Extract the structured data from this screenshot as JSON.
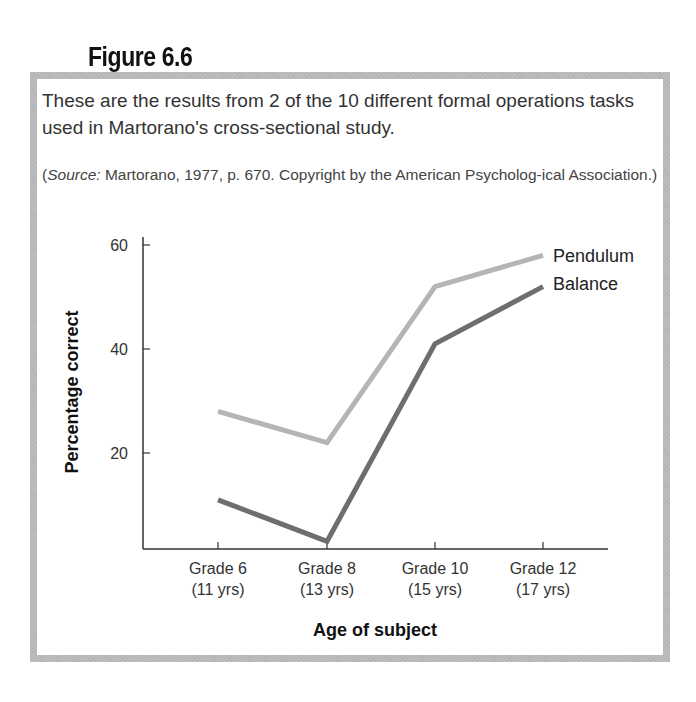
{
  "figure": {
    "label": "Figure 6.6",
    "caption": "These are the results from 2 of the 10 different formal operations tasks used in Martorano's cross-sectional study.",
    "source_prefix": "(",
    "source_italic": "Source:",
    "source_rest": " Martorano, 1977, p. 670. Copyright by the American Psycholog-ical Association.)"
  },
  "colors": {
    "frame": "#bdbdbd",
    "pendulum": "#b5b5b5",
    "balance": "#6e6e6e",
    "axis": "#333333"
  },
  "chart_data": {
    "type": "line",
    "title": "",
    "xlabel": "Age of subject",
    "ylabel": "Percentage correct",
    "categories": [
      "Grade 6 (11 yrs)",
      "Grade 8 (13 yrs)",
      "Grade 10 (15 yrs)",
      "Grade 12 (17 yrs)"
    ],
    "category_lines": [
      [
        "Grade 6",
        "(11 yrs)"
      ],
      [
        "Grade 8",
        "(13 yrs)"
      ],
      [
        "Grade 10",
        "(15 yrs)"
      ],
      [
        "Grade 12",
        "(17 yrs)"
      ]
    ],
    "yticks": [
      20,
      40,
      60
    ],
    "ylim": [
      0,
      62
    ],
    "grid": false,
    "legend_position": "inline-right",
    "series": [
      {
        "name": "Pendulum",
        "values": [
          28,
          22,
          52,
          58
        ]
      },
      {
        "name": "Balance",
        "values": [
          11,
          3,
          41,
          52
        ]
      }
    ]
  }
}
